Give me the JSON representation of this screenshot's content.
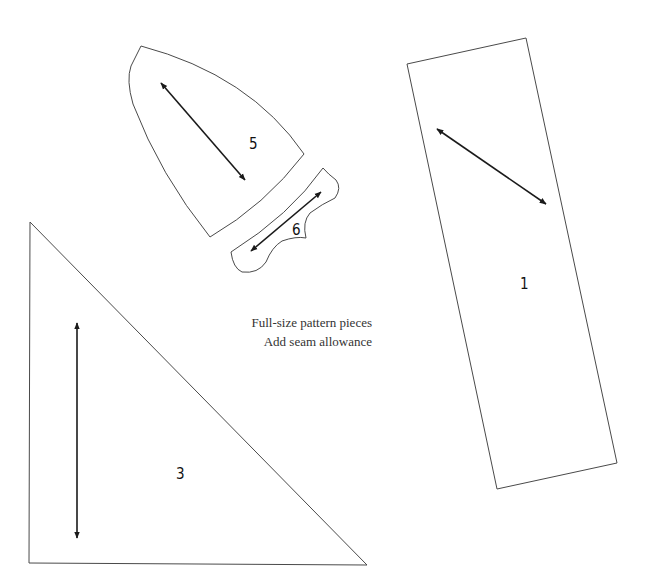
{
  "title": "Full-size pattern pieces",
  "caption": {
    "line1": "Full-size pattern pieces",
    "line2": "Add seam allowance"
  },
  "pieces": [
    {
      "id": "1",
      "label": "1",
      "shape": "rectangle",
      "grainline": "diagonal"
    },
    {
      "id": "3",
      "label": "3",
      "shape": "right-triangle",
      "grainline": "vertical"
    },
    {
      "id": "5",
      "label": "5",
      "shape": "curved-panel",
      "grainline": "diagonal"
    },
    {
      "id": "6",
      "label": "6",
      "shape": "curved-strip",
      "grainline": "diagonal"
    }
  ],
  "colors": {
    "outline": "#4a4a4a",
    "grainline": "#1a1a1a",
    "background": "#ffffff"
  }
}
